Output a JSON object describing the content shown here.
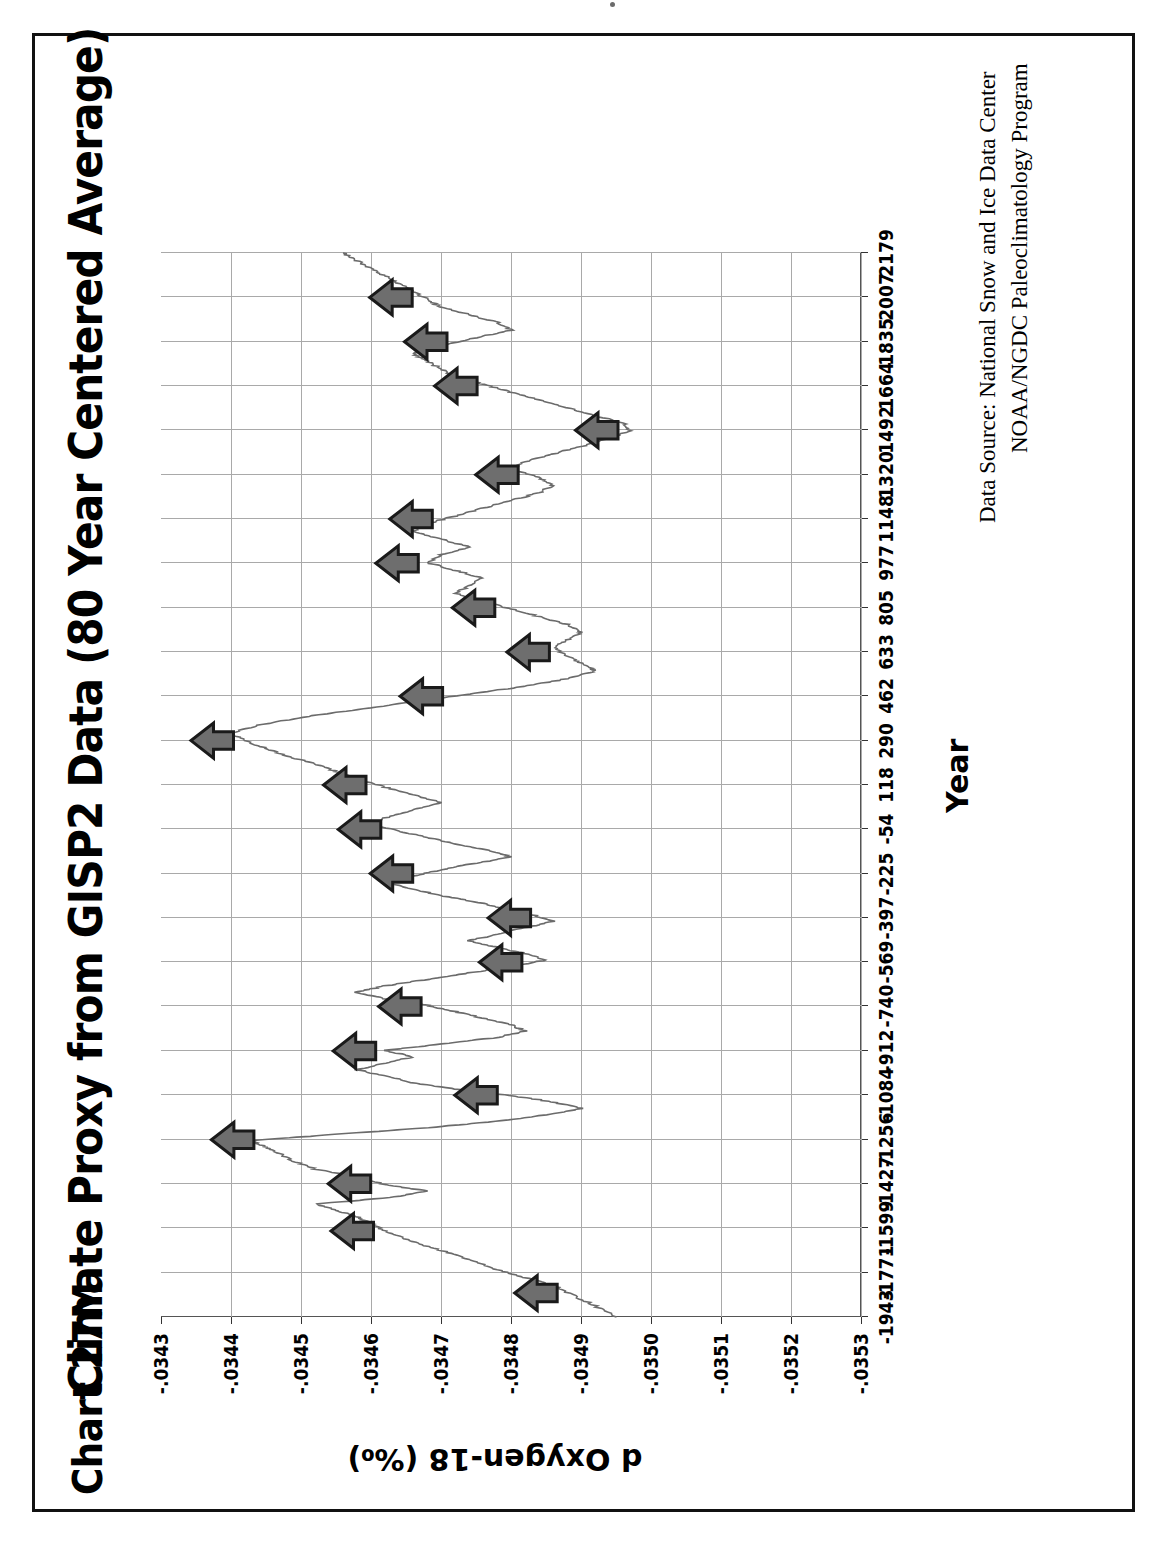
{
  "document": {
    "chart_tag": "Chart 27M",
    "frame_color": "#111111"
  },
  "chart": {
    "title": "Climate Proxy from GISP2 Data (80 Year Centered Average)",
    "source_line_1": "Data Source: National Snow and Ice Data Center",
    "source_line_2": "NOAA/NGDC Paleoclimatology Program",
    "x_axis_title": "Year",
    "y_axis_title": "d Oxygen-18 (‰)",
    "line_color": "#6b6b6b",
    "grid_color": "#a9a9a9",
    "arrow_fill": "#6e6e6e",
    "arrow_outline": "#1a1a1a",
    "rotation_note": "chart printed rotated 90 degrees counter-clockwise"
  },
  "chart_data": {
    "type": "line",
    "title": "Climate Proxy from GISP2 Data (80 Year Centered Average)",
    "xlabel": "Year",
    "ylabel": "d Oxygen-18 (‰)",
    "xlim": [
      -1943,
      2179
    ],
    "ylim": [
      -0.0353,
      -0.0343
    ],
    "grid": true,
    "legend": "none",
    "x_tick_labels": [
      "-1943",
      "-1771",
      "-1599",
      "-1427",
      "-1256",
      "-1084",
      "-912",
      "-740",
      "-569",
      "-397",
      "-225",
      "-54",
      "118",
      "290",
      "462",
      "633",
      "805",
      "977",
      "1148",
      "1320",
      "1492",
      "1664",
      "1835",
      "2007",
      "2179"
    ],
    "x_ticks": [
      -1943,
      -1771,
      -1599,
      -1427,
      -1256,
      -1084,
      -912,
      -740,
      -569,
      -397,
      -225,
      -54,
      118,
      290,
      462,
      633,
      805,
      977,
      1148,
      1320,
      1492,
      1664,
      1835,
      2007,
      2179
    ],
    "y_tick_labels": [
      "-.0343",
      "-.0344",
      "-.0345",
      "-.0346",
      "-.0347",
      "-.0348",
      "-.0349",
      "-.0350",
      "-.0351",
      "-.0352",
      "-.0353"
    ],
    "y_ticks": [
      -0.0343,
      -0.0344,
      -0.0345,
      -0.0346,
      -0.0347,
      -0.0348,
      -0.0349,
      -0.035,
      -0.0351,
      -0.0352,
      -0.0353
    ],
    "series": [
      {
        "name": "GISP2 d18O (80 yr centered average)",
        "x": [
          -1943,
          -1900,
          -1860,
          -1820,
          -1790,
          -1760,
          -1730,
          -1700,
          -1670,
          -1640,
          -1610,
          -1580,
          -1555,
          -1530,
          -1505,
          -1480,
          -1455,
          -1430,
          -1400,
          -1370,
          -1340,
          -1310,
          -1285,
          -1260,
          -1235,
          -1210,
          -1185,
          -1160,
          -1135,
          -1110,
          -1085,
          -1060,
          -1035,
          -1010,
          -985,
          -960,
          -935,
          -910,
          -885,
          -860,
          -835,
          -810,
          -785,
          -760,
          -735,
          -710,
          -685,
          -660,
          -635,
          -610,
          -585,
          -560,
          -535,
          -510,
          -485,
          -460,
          -435,
          -410,
          -385,
          -360,
          -335,
          -310,
          -285,
          -260,
          -235,
          -210,
          -185,
          -160,
          -135,
          -110,
          -85,
          -60,
          -35,
          -10,
          20,
          50,
          80,
          110,
          140,
          170,
          200,
          230,
          260,
          290,
          320,
          350,
          380,
          410,
          440,
          470,
          500,
          530,
          560,
          590,
          620,
          650,
          680,
          710,
          740,
          770,
          800,
          830,
          860,
          890,
          920,
          950,
          980,
          1010,
          1040,
          1070,
          1100,
          1130,
          1160,
          1190,
          1220,
          1250,
          1280,
          1310,
          1340,
          1370,
          1400,
          1430,
          1460,
          1490,
          1520,
          1550,
          1580,
          1610,
          1640,
          1670,
          1700,
          1730,
          1760,
          1790,
          1820,
          1850,
          1880,
          1910,
          1940,
          1970,
          2000,
          2030,
          2060,
          2090,
          2120,
          2150,
          2179
        ],
        "y": [
          -0.03495,
          -0.03492,
          -0.03489,
          -0.03486,
          -0.03482,
          -0.03478,
          -0.03475,
          -0.03472,
          -0.03468,
          -0.03465,
          -0.03462,
          -0.0346,
          -0.03458,
          -0.03455,
          -0.03452,
          -0.03463,
          -0.03468,
          -0.03462,
          -0.03458,
          -0.03452,
          -0.03449,
          -0.03447,
          -0.03445,
          -0.03443,
          -0.03455,
          -0.03468,
          -0.03478,
          -0.03485,
          -0.0349,
          -0.03486,
          -0.0348,
          -0.03472,
          -0.03466,
          -0.03462,
          -0.03458,
          -0.03462,
          -0.03466,
          -0.03462,
          -0.0347,
          -0.03478,
          -0.03482,
          -0.0348,
          -0.03476,
          -0.03472,
          -0.03468,
          -0.03462,
          -0.03458,
          -0.03462,
          -0.03468,
          -0.03474,
          -0.0348,
          -0.03485,
          -0.03482,
          -0.03478,
          -0.03474,
          -0.03478,
          -0.03482,
          -0.03486,
          -0.03483,
          -0.03479,
          -0.03475,
          -0.0347,
          -0.03466,
          -0.03462,
          -0.03466,
          -0.0347,
          -0.03475,
          -0.0348,
          -0.03477,
          -0.03472,
          -0.03468,
          -0.03464,
          -0.0346,
          -0.03462,
          -0.03466,
          -0.0347,
          -0.03466,
          -0.03462,
          -0.03458,
          -0.03455,
          -0.03452,
          -0.03448,
          -0.03445,
          -0.03442,
          -0.0344,
          -0.03444,
          -0.0345,
          -0.03458,
          -0.03466,
          -0.03474,
          -0.03482,
          -0.03488,
          -0.03492,
          -0.0349,
          -0.03488,
          -0.03486,
          -0.03488,
          -0.0349,
          -0.03488,
          -0.03484,
          -0.0348,
          -0.03476,
          -0.03472,
          -0.03474,
          -0.03476,
          -0.03472,
          -0.03468,
          -0.0347,
          -0.03474,
          -0.0347,
          -0.03466,
          -0.03468,
          -0.03472,
          -0.03476,
          -0.0348,
          -0.03484,
          -0.03486,
          -0.03484,
          -0.0348,
          -0.03482,
          -0.03486,
          -0.0349,
          -0.03494,
          -0.03497,
          -0.03496,
          -0.03492,
          -0.03488,
          -0.03484,
          -0.0348,
          -0.03476,
          -0.03472,
          -0.0347,
          -0.03468,
          -0.03466,
          -0.0347,
          -0.03475,
          -0.0348,
          -0.03478,
          -0.03474,
          -0.0347,
          -0.03468,
          -0.03466,
          -0.03464,
          -0.03462,
          -0.0346,
          -0.03458,
          -0.03456
        ]
      }
    ],
    "annotations": [
      {
        "label": "warm-peak-arrow",
        "year": -1850
      },
      {
        "label": "warm-peak-arrow",
        "year": -1610
      },
      {
        "label": "warm-peak-arrow",
        "year": -1256
      },
      {
        "label": "warm-peak-arrow",
        "year": -1427
      },
      {
        "label": "warm-peak-arrow",
        "year": -1084
      },
      {
        "label": "warm-peak-arrow",
        "year": -912
      },
      {
        "label": "warm-peak-arrow",
        "year": -740
      },
      {
        "label": "warm-peak-arrow",
        "year": -569
      },
      {
        "label": "warm-peak-arrow",
        "year": -397
      },
      {
        "label": "warm-peak-arrow",
        "year": -225
      },
      {
        "label": "warm-peak-arrow",
        "year": -54
      },
      {
        "label": "warm-peak-arrow",
        "year": 118
      },
      {
        "label": "warm-peak-arrow",
        "year": 290
      },
      {
        "label": "warm-peak-arrow",
        "year": 462
      },
      {
        "label": "warm-peak-arrow",
        "year": 633
      },
      {
        "label": "warm-peak-arrow",
        "year": 805
      },
      {
        "label": "warm-peak-arrow",
        "year": 977
      },
      {
        "label": "warm-peak-arrow",
        "year": 1148
      },
      {
        "label": "warm-peak-arrow",
        "year": 1320
      },
      {
        "label": "warm-peak-arrow",
        "year": 1492
      },
      {
        "label": "warm-peak-arrow",
        "year": 1664
      },
      {
        "label": "warm-peak-arrow",
        "year": 1835
      },
      {
        "label": "warm-peak-arrow",
        "year": 2007
      }
    ]
  }
}
